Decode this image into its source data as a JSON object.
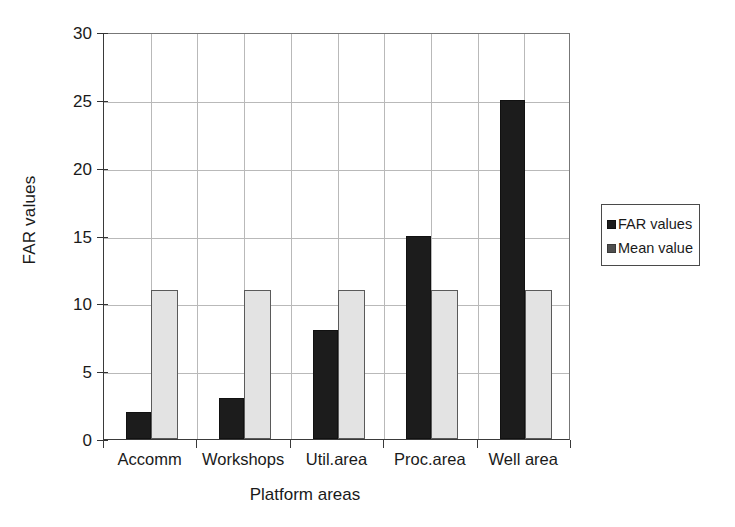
{
  "chart_data": {
    "type": "bar",
    "title": "",
    "xlabel": "Platform areas",
    "ylabel": "FAR values",
    "categories": [
      "Accomm",
      "Workshops",
      "Util.area",
      "Proc.area",
      "Well area"
    ],
    "series": [
      {
        "name": "FAR values",
        "color": "#1c1c1c",
        "values": [
          2,
          3,
          8,
          15,
          25
        ]
      },
      {
        "name": "Mean value",
        "color": "#e3e3e3",
        "values": [
          11,
          11,
          11,
          11,
          11
        ]
      }
    ],
    "ylim": [
      0,
      30
    ],
    "ytick_step": 5,
    "yticks": [
      0,
      5,
      10,
      15,
      20,
      25,
      30
    ],
    "ytick_labels": [
      "0",
      "5",
      "10",
      "15",
      "20",
      "25",
      "30"
    ],
    "grid": true,
    "grid_axis": "both",
    "legend_position": "right"
  },
  "legend": {
    "entries": [
      {
        "label": "FAR values",
        "swatch": "far"
      },
      {
        "label": "Mean value",
        "swatch": "mean"
      }
    ]
  }
}
